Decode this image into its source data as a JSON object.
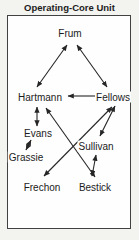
{
  "title": "Operating-Core Unit",
  "colors": {
    "ink": "#262626",
    "box_border": "#414141",
    "box_fill": "#fefefe",
    "page_bg": "#f3f3f0"
  },
  "diagram": {
    "type": "sociogram",
    "nodes": [
      {
        "id": "frum",
        "label": "Frum",
        "x": 70,
        "y": 33
      },
      {
        "id": "hartmann",
        "label": "Hartmann",
        "x": 40,
        "y": 97
      },
      {
        "id": "fellows",
        "label": "Fellows",
        "x": 113,
        "y": 97
      },
      {
        "id": "evans",
        "label": "Evans",
        "x": 38,
        "y": 133
      },
      {
        "id": "sullivan",
        "label": "Sullivan",
        "x": 96,
        "y": 146
      },
      {
        "id": "grassie",
        "label": "Grassie",
        "x": 26,
        "y": 157
      },
      {
        "id": "frechon",
        "label": "Frechon",
        "x": 42,
        "y": 187
      },
      {
        "id": "bestick",
        "label": "Bestick",
        "x": 95,
        "y": 187
      }
    ],
    "edges": [
      {
        "from": "frum",
        "to": "hartmann",
        "x1": 67,
        "y1": 45,
        "x2": 37,
        "y2": 87,
        "heads": "both"
      },
      {
        "from": "frum",
        "to": "fellows",
        "x1": 77,
        "y1": 45,
        "x2": 107,
        "y2": 87,
        "heads": "both"
      },
      {
        "from": "fellows",
        "to": "hartmann",
        "x1": 96,
        "y1": 96,
        "x2": 68,
        "y2": 96,
        "heads": "end"
      },
      {
        "from": "hartmann",
        "to": "evans",
        "x1": 37,
        "y1": 107,
        "x2": 37,
        "y2": 126,
        "heads": "both"
      },
      {
        "from": "evans",
        "to": "grassie",
        "x1": 31,
        "y1": 140,
        "x2": 26,
        "y2": 150,
        "heads": "both"
      },
      {
        "from": "hartmann",
        "to": "bestick",
        "x1": 46,
        "y1": 108,
        "x2": 95,
        "y2": 177,
        "heads": "both"
      },
      {
        "from": "fellows",
        "to": "frechon",
        "x1": 112,
        "y1": 107,
        "x2": 44,
        "y2": 176,
        "heads": "both"
      },
      {
        "from": "fellows",
        "to": "sullivan",
        "x1": 115,
        "y1": 106,
        "x2": 100,
        "y2": 136,
        "heads": "both"
      },
      {
        "from": "sullivan",
        "to": "bestick",
        "x1": 96,
        "y1": 155,
        "x2": 92,
        "y2": 176,
        "heads": "both"
      }
    ]
  }
}
